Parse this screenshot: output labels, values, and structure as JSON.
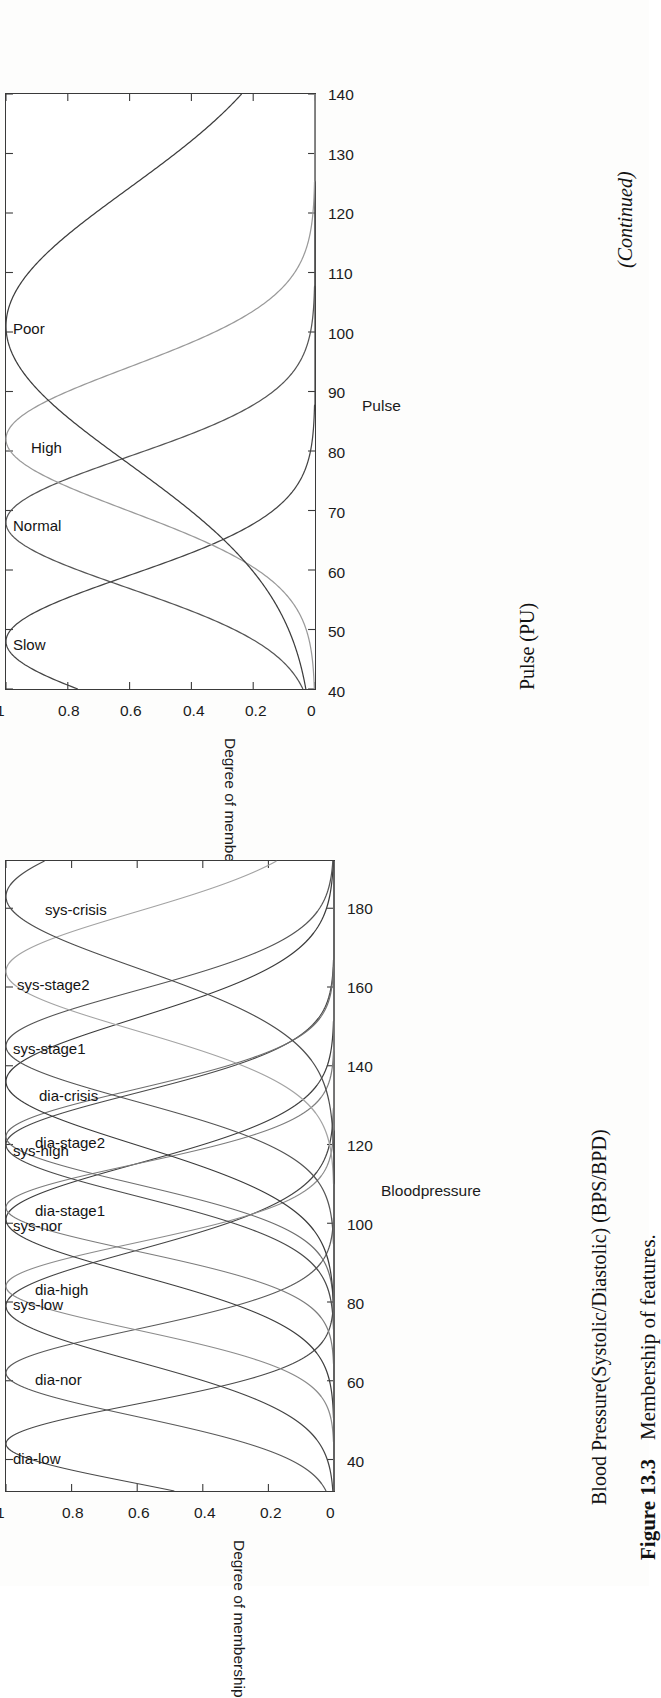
{
  "page": {
    "continued_note": "(Continued)",
    "figure_caption_label": "Figure 13.3",
    "figure_caption_text": "Membership of features."
  },
  "charts": [
    {
      "id": "pulse",
      "axis_caption": "Pulse (PU)",
      "chart_data": {
        "type": "line",
        "title": "",
        "xlabel": "Pulse",
        "ylabel": "Degree of membership",
        "xlim": [
          40,
          140
        ],
        "ylim": [
          0,
          1
        ],
        "xticks": [
          40,
          50,
          60,
          70,
          80,
          90,
          100,
          110,
          120,
          130,
          140
        ],
        "xticklabels": [
          "40",
          "50",
          "60",
          "70",
          "80",
          "90",
          "100",
          "110",
          "120",
          "130",
          "140"
        ],
        "yticks": [
          0,
          0.2,
          0.4,
          0.6,
          0.8,
          1
        ],
        "yticklabels": [
          "0",
          "0.2",
          "0.4",
          "0.6",
          "0.8",
          "1"
        ],
        "grid": false,
        "legend": "inline-annotations",
        "series": [
          {
            "name": "Slow",
            "peak_x": 48,
            "sigma": 11,
            "label_x": 48,
            "color": "#444444"
          },
          {
            "name": "Normal",
            "peak_x": 68,
            "sigma": 11,
            "label_x": 68,
            "color": "#555555"
          },
          {
            "name": "High",
            "peak_x": 82,
            "sigma": 12,
            "label_x": 81,
            "color": "#9a9a9a"
          },
          {
            "name": "Poor",
            "peak_x": 101,
            "sigma": 23,
            "label_x": 101,
            "color": "#3d3d3d"
          }
        ]
      }
    },
    {
      "id": "bloodpressure",
      "axis_caption": "Blood Pressure(Systolic/Diastolic) (BPS/BPD)",
      "chart_data": {
        "type": "line",
        "title": "",
        "xlabel": "Bloodpressure",
        "ylabel": "Degree of membership",
        "xlim": [
          32,
          192
        ],
        "ylim": [
          0,
          1
        ],
        "xticks": [
          40,
          60,
          80,
          100,
          120,
          140,
          160,
          180
        ],
        "xticklabels": [
          "40",
          "60",
          "80",
          "100",
          "120",
          "140",
          "160",
          "180"
        ],
        "yticks": [
          0,
          0.2,
          0.4,
          0.6,
          0.8,
          1
        ],
        "yticklabels": [
          "0",
          "0.2",
          "0.4",
          "0.6",
          "0.8",
          "1"
        ],
        "grid": false,
        "legend": "inline-annotations",
        "series": [
          {
            "name": "dia-low",
            "peak_x": 44,
            "sigma": 10,
            "label_x": 41,
            "color": "#4a4a4a"
          },
          {
            "name": "dia-nor",
            "peak_x": 62,
            "sigma": 11,
            "label_x": 61,
            "color": "#5a5a5a"
          },
          {
            "name": "sys-low",
            "peak_x": 79,
            "sigma": 14,
            "label_x": 80,
            "color": "#454545"
          },
          {
            "name": "dia-high",
            "peak_x": 84,
            "sigma": 11,
            "label_x": 84,
            "color": "#8c8c8c"
          },
          {
            "name": "sys-nor",
            "peak_x": 101,
            "sigma": 14,
            "label_x": 100,
            "color": "#3f3f3f"
          },
          {
            "name": "dia-stage1",
            "peak_x": 104,
            "sigma": 11,
            "label_x": 104,
            "color": "#7d7d7d"
          },
          {
            "name": "sys-high",
            "peak_x": 120,
            "sigma": 13,
            "label_x": 119,
            "color": "#4b4b4b"
          },
          {
            "name": "dia-stage2",
            "peak_x": 122,
            "sigma": 12,
            "label_x": 121,
            "color": "#6f6f6f"
          },
          {
            "name": "dia-crisis",
            "peak_x": 136,
            "sigma": 16,
            "label_x": 133,
            "color": "#3c3c3c"
          },
          {
            "name": "sys-stage1",
            "peak_x": 145,
            "sigma": 14,
            "label_x": 145,
            "color": "#555555"
          },
          {
            "name": "sys-stage2",
            "peak_x": 164,
            "sigma": 15,
            "label_x": 161,
            "color": "#a4a4a4"
          },
          {
            "name": "sys-crisis",
            "peak_x": 183,
            "sigma": 18,
            "label_x": 180,
            "color": "#4e4e4e"
          }
        ]
      }
    }
  ]
}
